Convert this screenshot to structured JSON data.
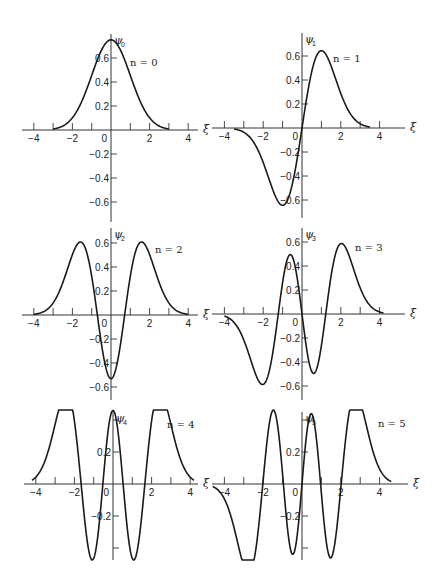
{
  "figure": {
    "x_axis_symbol": "ξ",
    "line_color": "#1a1a1a",
    "background": "#ffffff"
  },
  "chart_data": [
    {
      "type": "line",
      "panel": "n0",
      "title": "n = 0",
      "ylabel": "ψ0",
      "ylabel_base": "ψ",
      "ylabel_sub": "0",
      "xlabel": "ξ",
      "xticks": [
        -4,
        -2,
        0,
        2,
        4
      ],
      "xtick_labels": [
        "−4",
        "−2",
        "0",
        "2",
        "4"
      ],
      "yticks": [
        0.6,
        0.4,
        0.2,
        -0.2,
        -0.4,
        -0.6
      ],
      "ytick_labels": [
        "0.6",
        "0.4",
        "0.2",
        "−0.2",
        "−0.4",
        "−0.6"
      ],
      "xlim": [
        -4.5,
        4.5
      ],
      "ylim": [
        -0.7,
        0.78
      ],
      "grid": false,
      "peak": {
        "x": 0,
        "y": 0.75
      },
      "x": [
        -3.0,
        -2.0,
        -1.0,
        0,
        1.0,
        2.0,
        3.0
      ],
      "y": [
        0.008,
        0.102,
        0.456,
        0.751,
        0.456,
        0.102,
        0.008
      ]
    },
    {
      "type": "line",
      "panel": "n1",
      "title": "n = 1",
      "ylabel": "ψ1",
      "ylabel_base": "ψ",
      "ylabel_sub": "1",
      "xlabel": "ξ",
      "xticks": [
        -4,
        -2,
        0,
        2,
        4
      ],
      "xtick_labels": [
        "−4",
        "−2",
        "0",
        "2",
        "4"
      ],
      "yticks": [
        0.6,
        0.4,
        0.2,
        -0.2,
        -0.4,
        -0.6
      ],
      "ytick_labels": [
        "0.6",
        "0.4",
        "0.2",
        "−0.2",
        "−0.4",
        "−0.6"
      ],
      "xlim": [
        -4.5,
        4.5
      ],
      "ylim": [
        -0.7,
        0.78
      ],
      "grid": false,
      "extrema": [
        {
          "x": -1.0,
          "y": -0.64
        },
        {
          "x": 1.0,
          "y": 0.64
        }
      ],
      "x": [
        -3.5,
        -2.0,
        -1.0,
        0,
        1.0,
        2.0,
        3.5
      ],
      "y": [
        -0.0,
        -0.2,
        -0.64,
        0,
        0.64,
        0.2,
        0.0
      ]
    },
    {
      "type": "line",
      "panel": "n2",
      "title": "n = 2",
      "ylabel": "ψ2",
      "ylabel_base": "ψ",
      "ylabel_sub": "2",
      "xlabel": "ξ",
      "xticks": [
        -4,
        -2,
        0,
        2,
        4
      ],
      "xtick_labels": [
        "−4",
        "−2",
        "0",
        "2",
        "4"
      ],
      "yticks": [
        0.6,
        0.4,
        0.2,
        -0.2,
        -0.4,
        -0.6
      ],
      "ytick_labels": [
        "0.6",
        "0.4",
        "0.2",
        "−0.2",
        "−0.4",
        "−0.6"
      ],
      "xlim": [
        -4.5,
        4.5
      ],
      "ylim": [
        -0.7,
        0.7
      ],
      "grid": false,
      "extrema": [
        {
          "x": -1.6,
          "y": 0.6
        },
        {
          "x": 0,
          "y": -0.53
        },
        {
          "x": 1.6,
          "y": 0.6
        }
      ],
      "x": [
        -4.0,
        -1.6,
        -0.71,
        0,
        0.71,
        1.6,
        4.0
      ],
      "y": [
        0.0,
        0.6,
        0.0,
        -0.53,
        0.0,
        0.6,
        0.0
      ]
    },
    {
      "type": "line",
      "panel": "n3",
      "title": "n = 3",
      "ylabel": "ψ3",
      "ylabel_base": "ψ",
      "ylabel_sub": "3",
      "xlabel": "ξ",
      "xticks": [
        -4,
        -2,
        0,
        2,
        4
      ],
      "xtick_labels": [
        "−4",
        "−2",
        "0",
        "2",
        "4"
      ],
      "yticks": [
        0.6,
        0.4,
        0.2,
        -0.2,
        -0.4,
        -0.6
      ],
      "ytick_labels": [
        "0.6",
        "0.4",
        "0.2",
        "−0.2",
        "−0.4",
        "−0.6"
      ],
      "xlim": [
        -4.5,
        4.5
      ],
      "ylim": [
        -0.7,
        0.7
      ],
      "grid": false,
      "extrema": [
        {
          "x": -2.0,
          "y": -0.59
        },
        {
          "x": -0.6,
          "y": 0.51
        },
        {
          "x": 0.6,
          "y": -0.51
        },
        {
          "x": 2.0,
          "y": 0.59
        }
      ],
      "x": [
        -4.0,
        -2.0,
        -1.22,
        -0.6,
        0,
        0.6,
        1.22,
        2.0,
        4.2
      ],
      "y": [
        0.0,
        -0.59,
        0.0,
        0.51,
        0.0,
        -0.51,
        0.0,
        0.59,
        0.0
      ]
    },
    {
      "type": "line",
      "panel": "n4",
      "title": "n = 4",
      "ylabel": "ψ4",
      "ylabel_base": "ψ",
      "ylabel_sub": "4",
      "xlabel": "ξ",
      "xticks": [
        -4,
        -2,
        0,
        2,
        4
      ],
      "xtick_labels": [
        "−4",
        "−2",
        "0",
        "2",
        "4"
      ],
      "yticks": [
        0.2,
        -0.2
      ],
      "ytick_labels": [
        "0.2",
        "−0.2"
      ],
      "extra_yticks": [
        0.4,
        -0.4
      ],
      "xlim": [
        -4.5,
        4.5
      ],
      "ylim": [
        -0.6,
        0.55
      ],
      "grid": false,
      "extrema": [
        {
          "x": -2.4,
          "y": 0.54
        },
        {
          "x": -1.0,
          "y": -0.44
        },
        {
          "x": 0,
          "y": 0.43
        },
        {
          "x": 1.0,
          "y": -0.44
        },
        {
          "x": 2.4,
          "y": 0.54
        }
      ],
      "x": [
        -4.2,
        -2.4,
        -1.65,
        -1.0,
        -0.52,
        0,
        0.52,
        1.0,
        1.65,
        2.4,
        4.2
      ],
      "y": [
        0.0,
        0.54,
        0.0,
        -0.44,
        0.0,
        0.43,
        0.0,
        -0.44,
        0.0,
        0.54,
        0.0
      ]
    },
    {
      "type": "line",
      "panel": "n5",
      "title": "n = 5",
      "ylabel": "ψ5",
      "ylabel_base": "ψ",
      "ylabel_sub": "5",
      "xlabel": "ξ",
      "xticks": [
        -4,
        -2,
        0,
        2,
        4
      ],
      "xtick_labels": [
        "−4",
        "−2",
        "0",
        "2",
        "4"
      ],
      "yticks": [
        0.2,
        -0.2
      ],
      "ytick_labels": [
        "0.2",
        "−0.2"
      ],
      "extra_yticks": [
        0.4,
        -0.4
      ],
      "xlim": [
        -4.5,
        4.5
      ],
      "ylim": [
        -0.6,
        0.55
      ],
      "grid": false,
      "extrema": [
        {
          "x": -2.75,
          "y": -0.52
        },
        {
          "x": -1.35,
          "y": 0.43
        },
        {
          "x": -0.45,
          "y": -0.39
        },
        {
          "x": 0.45,
          "y": 0.39
        },
        {
          "x": 1.35,
          "y": -0.43
        },
        {
          "x": 2.75,
          "y": 0.52
        }
      ],
      "x": [
        -4.6,
        -2.75,
        -2.02,
        -1.35,
        -0.96,
        -0.45,
        0,
        0.45,
        0.96,
        1.35,
        2.02,
        2.75,
        4.6
      ],
      "y": [
        0.0,
        -0.52,
        0.0,
        0.43,
        0.0,
        -0.39,
        0.0,
        0.39,
        0.0,
        -0.43,
        0.0,
        0.52,
        0.0
      ]
    }
  ]
}
